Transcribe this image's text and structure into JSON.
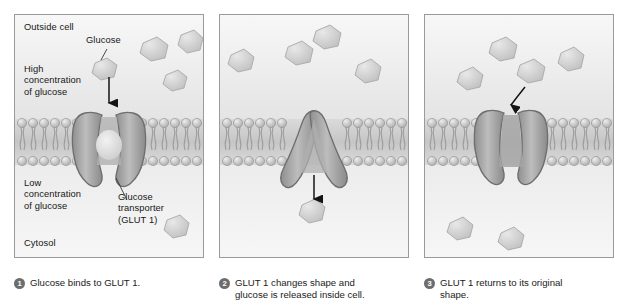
{
  "figure": {
    "background": "#ffffff",
    "panel_border_color": "#9a9a9a",
    "membrane_head_color": "#b9b9b9",
    "protein_color": "#a0a0a0",
    "glucose_color": "#cfcfcf",
    "arrow_color": "#1b1b1b",
    "bullet_color": "#6d6d6d"
  },
  "panels": [
    {
      "id": "panel-1",
      "labels": {
        "outside": "Outside cell",
        "glucose": "Glucose",
        "high_conc": "High\nconcentration\nof glucose",
        "low_conc": "Low\nconcentration\nof glucose",
        "transporter": "Glucose\ntransporter\n(GLUT 1)",
        "cytosol": "Cytosol"
      },
      "caption": {
        "number": "1",
        "text": "Glucose binds to GLUT 1."
      },
      "glucose_outside_count": 4,
      "glucose_inside_count": 1,
      "transporter_state": "open-outward",
      "arrow_direction": "down"
    },
    {
      "id": "panel-2",
      "caption": {
        "number": "2",
        "text": "GLUT 1 changes shape and\nglucose is released inside cell."
      },
      "glucose_outside_count": 4,
      "glucose_inside_count": 1,
      "transporter_state": "open-inward",
      "arrow_direction": "down"
    },
    {
      "id": "panel-3",
      "caption": {
        "number": "3",
        "text": "GLUT 1 returns to its original\nshape."
      },
      "glucose_outside_count": 4,
      "glucose_inside_count": 2,
      "transporter_state": "open-outward",
      "arrow_direction": "curved-down-left"
    }
  ]
}
